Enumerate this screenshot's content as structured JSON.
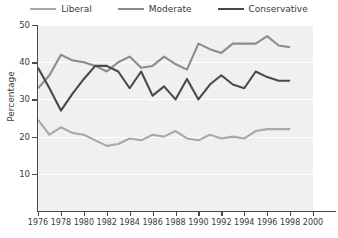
{
  "chart_data": {
    "type": "line",
    "title": "",
    "xlabel": "",
    "ylabel": "Percentage",
    "xlim": [
      1976,
      2000
    ],
    "ylim": [
      0,
      50
    ],
    "grid": true,
    "legend_position": "top-center",
    "x": [
      1976,
      1977,
      1978,
      1979,
      1980,
      1981,
      1982,
      1983,
      1984,
      1985,
      1986,
      1987,
      1988,
      1989,
      1990,
      1991,
      1992,
      1993,
      1994,
      1995,
      1996,
      1997,
      1998
    ],
    "xticks": [
      "1976",
      "1978",
      "1980",
      "1982",
      "1984",
      "1986",
      "1988",
      "1990",
      "1992",
      "1994",
      "1996",
      "1998",
      "2000"
    ],
    "yticks": [
      "10",
      "20",
      "30",
      "40",
      "50"
    ],
    "series": [
      {
        "name": "Liberal",
        "color": "#a8a8a8",
        "values": [
          24.5,
          20.5,
          22.5,
          21.0,
          20.5,
          19.0,
          17.5,
          18.0,
          19.5,
          19.0,
          20.5,
          20.0,
          21.5,
          19.5,
          19.0,
          20.5,
          19.5,
          20.0,
          19.5,
          21.5,
          22.0,
          22.0,
          22.0
        ]
      },
      {
        "name": "Moderate",
        "color": "#8c8c8c",
        "values": [
          33.0,
          36.5,
          42.0,
          40.5,
          40.0,
          39.0,
          37.5,
          40.0,
          41.5,
          38.5,
          39.0,
          41.5,
          39.5,
          38.0,
          45.0,
          43.5,
          42.5,
          45.0,
          45.0,
          45.0,
          47.0,
          44.5,
          44.0
        ]
      },
      {
        "name": "Conservative",
        "color": "#4a4a4a",
        "values": [
          38.5,
          33.0,
          27.0,
          31.5,
          35.5,
          39.0,
          39.0,
          37.5,
          33.0,
          37.5,
          31.0,
          33.5,
          30.0,
          35.5,
          30.0,
          34.0,
          36.5,
          34.0,
          33.0,
          37.5,
          36.0,
          35.0,
          35.0
        ]
      }
    ]
  },
  "legend": {
    "items": [
      {
        "label": "Liberal"
      },
      {
        "label": "Moderate"
      },
      {
        "label": "Conservative"
      }
    ]
  },
  "axes": {
    "y_title": "Percentage"
  }
}
